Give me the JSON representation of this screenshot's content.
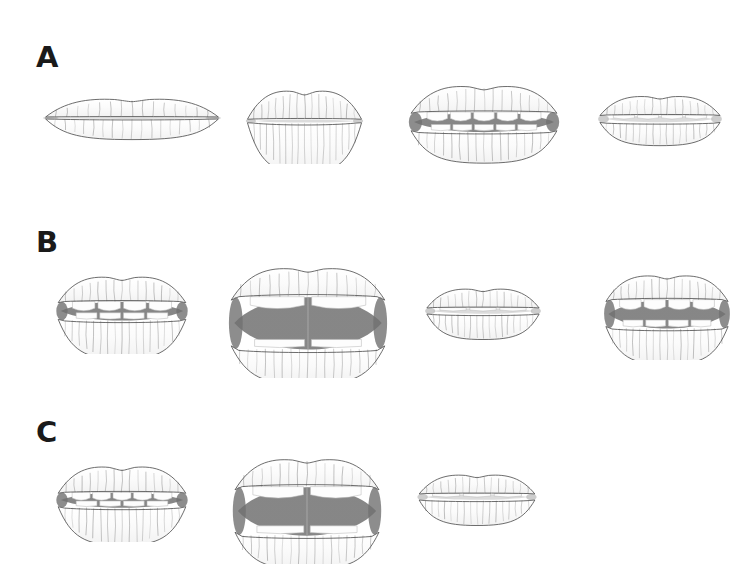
{
  "figure": {
    "background_color": "#ffffff",
    "ink_color": "#4a4a4a",
    "mouth_interior_color": "#808080",
    "tooth_color": "#fdfdfd",
    "label_color": "#1a1a1a",
    "width": 754,
    "height": 586,
    "panel_count": 3,
    "total_items": 11
  },
  "panels": [
    {
      "id": "panel-a",
      "label": "A",
      "label_x": 36,
      "label_y": 43,
      "row_y": 80,
      "items": [
        {
          "name": "lips-a1",
          "aperture": "closed-thin",
          "x": 42,
          "y": 88,
          "w": 180,
          "h": 60,
          "scale": 1.0,
          "upper_lip_h": 0.3,
          "lower_lip_h": 0.34,
          "open_h": 0.04,
          "width_ratio": 1.0,
          "interior_visible": false,
          "teeth_upper": 0,
          "teeth_lower": 0,
          "description": "narrow closed mouth, wide flat lips"
        },
        {
          "name": "lips-a2",
          "aperture": "closed-pursed",
          "x": 232,
          "y": 78,
          "w": 145,
          "h": 86,
          "scale": 1.0,
          "upper_lip_h": 0.33,
          "lower_lip_h": 0.58,
          "open_h": 0.05,
          "width_ratio": 0.82,
          "interior_visible": false,
          "teeth_upper": 0,
          "teeth_lower": 0,
          "description": "pursed closed mouth, full lower lip"
        },
        {
          "name": "lips-a3",
          "aperture": "open-teeth",
          "x": 404,
          "y": 80,
          "w": 160,
          "h": 84,
          "scale": 1.0,
          "upper_lip_h": 0.3,
          "lower_lip_h": 0.36,
          "open_h": 0.26,
          "width_ratio": 0.95,
          "interior_visible": true,
          "teeth_upper": 5,
          "teeth_lower": 5,
          "description": "open mouth showing upper and lower teeth, dark corners"
        },
        {
          "name": "lips-a4",
          "aperture": "slightly-open",
          "x": 592,
          "y": 88,
          "w": 136,
          "h": 62,
          "scale": 1.0,
          "upper_lip_h": 0.3,
          "lower_lip_h": 0.36,
          "open_h": 0.14,
          "width_ratio": 0.92,
          "interior_visible": false,
          "teeth_upper": 4,
          "teeth_lower": 0,
          "description": "slightly parted lips, faint teeth line"
        }
      ]
    },
    {
      "id": "panel-b",
      "label": "B",
      "label_x": 36,
      "label_y": 228,
      "row_y": 262,
      "items": [
        {
          "name": "lips-b1",
          "aperture": "open-teeth",
          "x": 52,
          "y": 268,
          "w": 140,
          "h": 86,
          "scale": 1.0,
          "upper_lip_h": 0.28,
          "lower_lip_h": 0.44,
          "open_h": 0.24,
          "width_ratio": 0.95,
          "interior_visible": true,
          "teeth_upper": 4,
          "teeth_lower": 4,
          "description": "open mouth, dark interior band, teeth rows"
        },
        {
          "name": "lips-b2",
          "aperture": "wide-open",
          "x": 228,
          "y": 268,
          "w": 160,
          "h": 110,
          "scale": 1.0,
          "upper_lip_h": 0.24,
          "lower_lip_h": 0.3,
          "open_h": 0.52,
          "width_ratio": 1.0,
          "interior_visible": true,
          "teeth_upper": 2,
          "teeth_lower": 2,
          "description": "widely open mouth, large dark interior, full lips"
        },
        {
          "name": "lips-b3",
          "aperture": "slightly-open",
          "x": 418,
          "y": 280,
          "w": 130,
          "h": 62,
          "scale": 1.0,
          "upper_lip_h": 0.3,
          "lower_lip_h": 0.4,
          "open_h": 0.12,
          "width_ratio": 0.9,
          "interior_visible": false,
          "teeth_upper": 3,
          "teeth_lower": 0,
          "description": "thin parted lips, pale teeth glimpse"
        },
        {
          "name": "lips-b4",
          "aperture": "open-teeth",
          "x": 600,
          "y": 268,
          "w": 134,
          "h": 92,
          "scale": 1.0,
          "upper_lip_h": 0.25,
          "lower_lip_h": 0.38,
          "open_h": 0.34,
          "width_ratio": 0.95,
          "interior_visible": true,
          "teeth_upper": 4,
          "teeth_lower": 4,
          "description": "open mouth with dark interior and two teeth rows"
        }
      ]
    },
    {
      "id": "panel-c",
      "label": "C",
      "label_x": 36,
      "label_y": 418,
      "row_y": 452,
      "items": [
        {
          "name": "lips-c1",
          "aperture": "open-teeth",
          "x": 52,
          "y": 458,
          "w": 140,
          "h": 84,
          "scale": 1.0,
          "upper_lip_h": 0.3,
          "lower_lip_h": 0.44,
          "open_h": 0.2,
          "width_ratio": 0.95,
          "interior_visible": true,
          "teeth_upper": 5,
          "teeth_lower": 4,
          "description": "open mouth, teeth visible, dark corners"
        },
        {
          "name": "lips-c2",
          "aperture": "wide-open",
          "x": 232,
          "y": 458,
          "w": 150,
          "h": 106,
          "scale": 1.0,
          "upper_lip_h": 0.24,
          "lower_lip_h": 0.3,
          "open_h": 0.5,
          "width_ratio": 1.0,
          "interior_visible": true,
          "teeth_upper": 2,
          "teeth_lower": 2,
          "description": "widely open mouth, large dark interior"
        },
        {
          "name": "lips-c3",
          "aperture": "slightly-open",
          "x": 410,
          "y": 466,
          "w": 134,
          "h": 62,
          "scale": 1.0,
          "upper_lip_h": 0.3,
          "lower_lip_h": 0.4,
          "open_h": 0.12,
          "width_ratio": 0.9,
          "interior_visible": false,
          "teeth_upper": 3,
          "teeth_lower": 0,
          "description": "thin parted lips, faint interior"
        }
      ]
    }
  ]
}
